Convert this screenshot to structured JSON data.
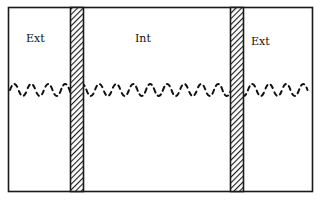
{
  "diagram": {
    "type": "membrane-cross-section",
    "regions": [
      {
        "id": "left",
        "label": "Ext"
      },
      {
        "id": "center",
        "label": "Int"
      },
      {
        "id": "right",
        "label": "Ext"
      }
    ],
    "membranes": [
      {
        "id": "left-membrane",
        "pattern": "diagonal-hatch"
      },
      {
        "id": "right-membrane",
        "pattern": "diagonal-hatch"
      }
    ],
    "wave": {
      "style": "dashed-sine",
      "spans": "full-width"
    },
    "colors": {
      "stroke": "#1a1a1a",
      "background": "#ffffff"
    }
  }
}
